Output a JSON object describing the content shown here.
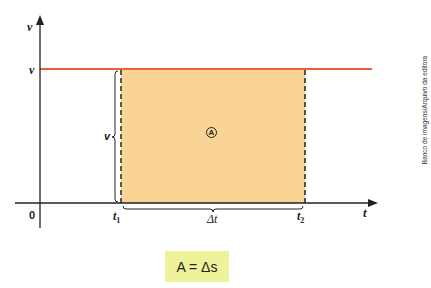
{
  "diagram": {
    "type": "velocity-time graph",
    "y_axis_label": "v",
    "x_axis_label": "t",
    "origin_label": "0",
    "constant_velocity_label": "v",
    "height_brace_label": "v",
    "t1_label": "t",
    "t1_sub": "1",
    "t2_label": "t",
    "t2_sub": "2",
    "delta_t_label": "Δt",
    "area_marker": "A",
    "formula": "A = Δs",
    "credit": "Banco de imagens/Arquivo da editora",
    "colors": {
      "line": "#e8603c",
      "area_fill": "#f9d494",
      "formula_bg": "#eef29a",
      "axis": "#222222"
    }
  }
}
